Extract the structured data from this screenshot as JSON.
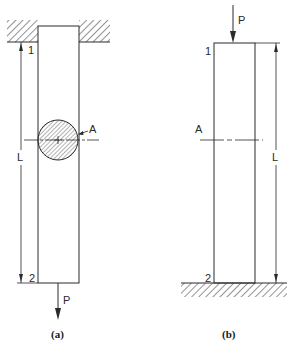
{
  "figure_a": {
    "caption": "(a)",
    "end_top_label": "1",
    "end_bottom_label": "2",
    "length_label": "L",
    "area_label": "A",
    "load_label": "P",
    "support": "fixed-top-hatched",
    "load_direction": "down (tension)"
  },
  "figure_b": {
    "caption": "(b)",
    "end_top_label": "1",
    "end_bottom_label": "2",
    "length_label": "L",
    "area_label": "A",
    "load_label": "P",
    "support": "fixed-bottom-hatched",
    "load_direction": "down (compression)"
  },
  "colors": {
    "line": "#2a2a2a",
    "background": "#ffffff"
  }
}
